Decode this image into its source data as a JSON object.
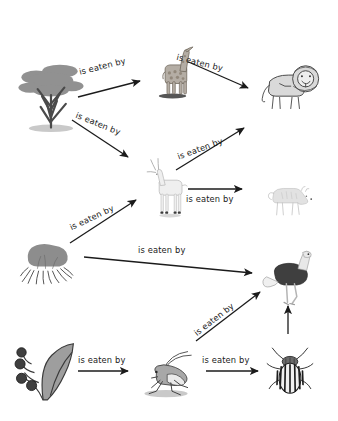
{
  "diagram": {
    "relation_label": "is eaten by",
    "stroke_color": "#1b1b1b"
  },
  "nodes": [
    {
      "id": "acacia-tree",
      "name": "acacia-tree",
      "label": "acacia tree",
      "type": "producer",
      "x": 14,
      "y": 56,
      "w": 74,
      "h": 78,
      "fill": "#9a9a9a"
    },
    {
      "id": "giraffe",
      "name": "giraffe",
      "label": "giraffe",
      "type": "herbivore",
      "x": 144,
      "y": 28,
      "w": 62,
      "h": 80,
      "fill": "#b4ada4"
    },
    {
      "id": "lion",
      "name": "lion",
      "label": "lion",
      "type": "predator",
      "x": 252,
      "y": 54,
      "w": 80,
      "h": 62,
      "fill": "#d9d9d9"
    },
    {
      "id": "gazelle",
      "name": "gazelle",
      "label": "gazelle",
      "type": "herbivore",
      "x": 140,
      "y": 148,
      "w": 60,
      "h": 80,
      "fill": "#efefef"
    },
    {
      "id": "hyena",
      "name": "hyena",
      "label": "hyena",
      "type": "predator",
      "x": 254,
      "y": 176,
      "w": 76,
      "h": 48,
      "fill": "#e2e2e2"
    },
    {
      "id": "grass-bush",
      "name": "grass-bush",
      "label": "grass bush",
      "type": "producer",
      "x": 12,
      "y": 234,
      "w": 74,
      "h": 58,
      "fill": "#8d8d8d"
    },
    {
      "id": "ostrich",
      "name": "ostrich",
      "label": "ostrich",
      "type": "omnivore",
      "x": 262,
      "y": 238,
      "w": 58,
      "h": 80,
      "fill": "#3f3f3f"
    },
    {
      "id": "leaf-berries",
      "name": "leaf-berries",
      "label": "leaf with berries",
      "type": "producer",
      "x": 10,
      "y": 338,
      "w": 72,
      "h": 72,
      "fill": "#6f6f6f"
    },
    {
      "id": "grasshopper",
      "name": "grasshopper",
      "label": "grasshopper",
      "type": "herbivore",
      "x": 128,
      "y": 342,
      "w": 76,
      "h": 60,
      "fill": "#a8a8a8"
    },
    {
      "id": "beetle",
      "name": "beetle",
      "label": "beetle",
      "type": "herbivore",
      "x": 264,
      "y": 336,
      "w": 52,
      "h": 72,
      "fill": "#2b2b2b"
    }
  ],
  "edges": [
    {
      "id": "e1",
      "name": "edge-acacia-to-giraffe",
      "from": "acacia-tree",
      "to": "giraffe",
      "label": "is eaten by",
      "x1": 78,
      "y1": 97,
      "x2": 140,
      "y2": 81,
      "lx": 78,
      "ly": 67,
      "rot": -14
    },
    {
      "id": "e2",
      "name": "edge-giraffe-to-lion",
      "from": "giraffe",
      "to": "lion",
      "label": "is eaten by",
      "x1": 184,
      "y1": 60,
      "x2": 248,
      "y2": 88,
      "lx": 178,
      "ly": 52,
      "rot": 14
    },
    {
      "id": "e3",
      "name": "edge-acacia-to-gazelle",
      "from": "acacia-tree",
      "to": "gazelle",
      "label": "is eaten by",
      "x1": 72,
      "y1": 120,
      "x2": 128,
      "y2": 157,
      "lx": 78,
      "ly": 110,
      "rot": 22
    },
    {
      "id": "e4",
      "name": "edge-gazelle-to-lion",
      "from": "gazelle",
      "to": "lion",
      "label": "is eaten by",
      "x1": 176,
      "y1": 170,
      "x2": 244,
      "y2": 128,
      "lx": 176,
      "ly": 152,
      "rot": -20
    },
    {
      "id": "e5",
      "name": "edge-gazelle-to-hyena",
      "from": "gazelle",
      "to": "hyena",
      "label": "is eaten by",
      "x1": 188,
      "y1": 189,
      "x2": 242,
      "y2": 189,
      "lx": 186,
      "ly": 194,
      "rot": 0
    },
    {
      "id": "e6",
      "name": "edge-grassbush-to-gazelle",
      "from": "grass-bush",
      "to": "gazelle",
      "label": "is eaten by",
      "x1": 70,
      "y1": 243,
      "x2": 136,
      "y2": 200,
      "lx": 68,
      "ly": 223,
      "rot": -25
    },
    {
      "id": "e7",
      "name": "edge-grassbush-to-ostrich",
      "from": "grass-bush",
      "to": "ostrich",
      "label": "is eaten by",
      "x1": 84,
      "y1": 257,
      "x2": 252,
      "y2": 273,
      "lx": 138,
      "ly": 245,
      "rot": 0
    },
    {
      "id": "e8",
      "name": "edge-grasshopper-to-ostrich",
      "from": "grasshopper",
      "to": "ostrich",
      "label": "is eaten by",
      "x1": 196,
      "y1": 341,
      "x2": 260,
      "y2": 292,
      "lx": 192,
      "ly": 330,
      "rot": -38
    },
    {
      "id": "e9",
      "name": "edge-leaf-to-grasshopper",
      "from": "leaf-berries",
      "to": "grasshopper",
      "label": "is eaten by",
      "x1": 78,
      "y1": 371,
      "x2": 128,
      "y2": 371,
      "lx": 78,
      "ly": 355,
      "rot": 0
    },
    {
      "id": "e10",
      "name": "edge-grasshopper-to-beetle",
      "from": "grasshopper",
      "to": "beetle",
      "label": "is eaten by",
      "x1": 206,
      "y1": 371,
      "x2": 258,
      "y2": 371,
      "lx": 202,
      "ly": 355,
      "rot": 0
    },
    {
      "id": "e11",
      "name": "edge-beetle-to-ostrich",
      "from": "beetle",
      "to": "ostrich",
      "label": "",
      "x1": 288,
      "y1": 334,
      "x2": 288,
      "y2": 306,
      "lx": 0,
      "ly": 0,
      "rot": 0
    }
  ]
}
